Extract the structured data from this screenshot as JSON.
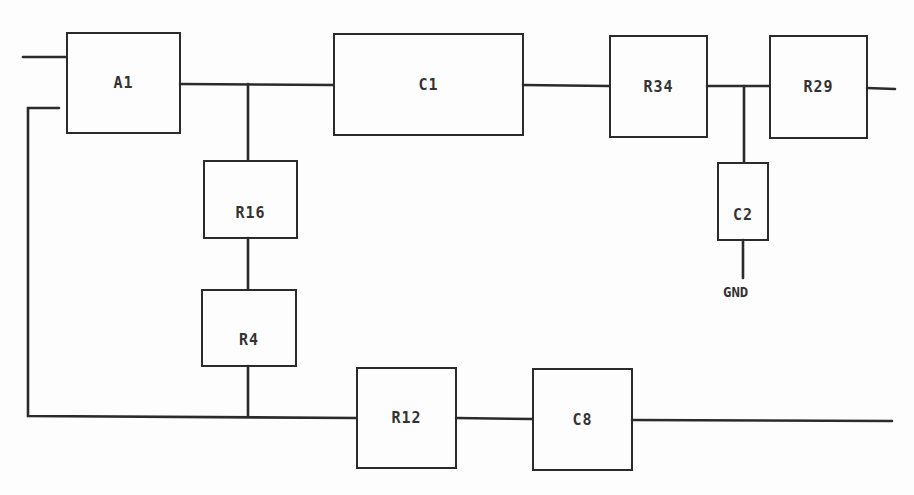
{
  "diagram": {
    "type": "block schematic",
    "components": [
      {
        "id": "A1",
        "label": "A1"
      },
      {
        "id": "C1",
        "label": "C1"
      },
      {
        "id": "R34",
        "label": "R34"
      },
      {
        "id": "R29",
        "label": "R29"
      },
      {
        "id": "R16",
        "label": "R16"
      },
      {
        "id": "C2",
        "label": "C2"
      },
      {
        "id": "R4",
        "label": "R4"
      },
      {
        "id": "R12",
        "label": "R12"
      },
      {
        "id": "C8",
        "label": "C8"
      }
    ],
    "ground_label": "GND",
    "connections": [
      [
        "input",
        "A1"
      ],
      [
        "A1",
        "C1"
      ],
      [
        "A1-C1 node",
        "R16"
      ],
      [
        "R16",
        "R4"
      ],
      [
        "R4",
        "bottom bus"
      ],
      [
        "C1",
        "R34"
      ],
      [
        "R34",
        "R29"
      ],
      [
        "R34-R29 node",
        "C2"
      ],
      [
        "C2",
        "GND"
      ],
      [
        "R29",
        "output"
      ],
      [
        "A1 feedback",
        "bottom bus"
      ],
      [
        "bottom bus",
        "R12"
      ],
      [
        "R12",
        "C8"
      ],
      [
        "C8",
        "output"
      ]
    ]
  }
}
